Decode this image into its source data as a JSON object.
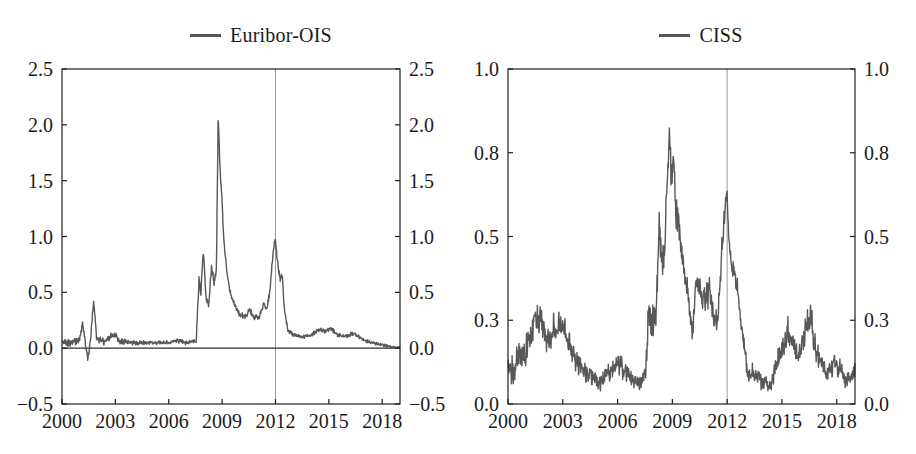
{
  "figure": {
    "background": "#ffffff",
    "text_color": "#1b1b1b",
    "frame_color": "#1f1f1f"
  },
  "charts": [
    {
      "legend": {
        "label": "Euribor-OIS",
        "swatch_color": "#585858"
      },
      "chart_data": {
        "type": "line",
        "title": "Euribor-OIS",
        "xlabel": "",
        "ylabel": "",
        "grid": false,
        "legend_position": "top-center",
        "x_axis": {
          "min": 2000,
          "max": 2019,
          "ticks": [
            2000,
            2003,
            2006,
            2009,
            2012,
            2015,
            2018
          ],
          "tick_labels": [
            "2000",
            "2003",
            "2006",
            "2009",
            "2012",
            "2015",
            "2018"
          ]
        },
        "y_axis": {
          "min": -0.5,
          "max": 2.5,
          "ticks": [
            -0.5,
            0,
            0.5,
            1,
            1.5,
            2,
            2.5
          ],
          "tick_labels": [
            "−0.5",
            "0.0",
            "0.5",
            "1.0",
            "1.5",
            "2.0",
            "2.5"
          ],
          "label_sides": "both"
        },
        "reference_lines": {
          "vertical_x": 2012,
          "vertical_color": "#9b9b9b",
          "horizontal_y": 0,
          "horizontal_color": "#2a2a2a"
        },
        "series": [
          {
            "name": "Euribor-OIS",
            "color": "#585858",
            "anchors": [
              [
                2000.0,
                0.05,
                0.035
              ],
              [
                2000.6,
                0.05,
                0.035
              ],
              [
                2001.0,
                0.08,
                0.05
              ],
              [
                2001.15,
                0.22,
                0.03
              ],
              [
                2001.3,
                0.06,
                0.04
              ],
              [
                2001.45,
                -0.1,
                0.03
              ],
              [
                2001.6,
                0.07,
                0.04
              ],
              [
                2001.78,
                0.43,
                0.02
              ],
              [
                2001.95,
                0.07,
                0.04
              ],
              [
                2002.4,
                0.06,
                0.035
              ],
              [
                2002.9,
                0.13,
                0.035
              ],
              [
                2003.3,
                0.06,
                0.03
              ],
              [
                2004.0,
                0.05,
                0.025
              ],
              [
                2005.0,
                0.05,
                0.02
              ],
              [
                2006.0,
                0.05,
                0.02
              ],
              [
                2006.5,
                0.07,
                0.025
              ],
              [
                2007.0,
                0.05,
                0.02
              ],
              [
                2007.55,
                0.06,
                0.02
              ],
              [
                2007.62,
                0.35,
                0.04
              ],
              [
                2007.7,
                0.62,
                0.05
              ],
              [
                2007.8,
                0.5,
                0.05
              ],
              [
                2007.95,
                0.88,
                0.04
              ],
              [
                2008.1,
                0.45,
                0.05
              ],
              [
                2008.25,
                0.38,
                0.04
              ],
              [
                2008.4,
                0.72,
                0.05
              ],
              [
                2008.55,
                0.6,
                0.04
              ],
              [
                2008.68,
                0.7,
                0.04
              ],
              [
                2008.78,
                2.07,
                0.03
              ],
              [
                2008.9,
                1.55,
                0.06
              ],
              [
                2009.0,
                1.3,
                0.05
              ],
              [
                2009.1,
                0.95,
                0.05
              ],
              [
                2009.25,
                0.7,
                0.04
              ],
              [
                2009.45,
                0.5,
                0.03
              ],
              [
                2009.7,
                0.38,
                0.03
              ],
              [
                2010.0,
                0.3,
                0.025
              ],
              [
                2010.35,
                0.28,
                0.03
              ],
              [
                2010.55,
                0.35,
                0.03
              ],
              [
                2010.8,
                0.27,
                0.025
              ],
              [
                2011.1,
                0.28,
                0.03
              ],
              [
                2011.35,
                0.4,
                0.03
              ],
              [
                2011.5,
                0.33,
                0.03
              ],
              [
                2011.65,
                0.48,
                0.03
              ],
              [
                2011.8,
                0.72,
                0.04
              ],
              [
                2011.97,
                1.0,
                0.03
              ],
              [
                2012.1,
                0.8,
                0.04
              ],
              [
                2012.25,
                0.62,
                0.03
              ],
              [
                2012.38,
                0.66,
                0.03
              ],
              [
                2012.5,
                0.35,
                0.03
              ],
              [
                2012.7,
                0.16,
                0.02
              ],
              [
                2013.0,
                0.12,
                0.02
              ],
              [
                2013.5,
                0.1,
                0.02
              ],
              [
                2014.0,
                0.12,
                0.02
              ],
              [
                2014.5,
                0.17,
                0.02
              ],
              [
                2014.8,
                0.15,
                0.02
              ],
              [
                2015.1,
                0.18,
                0.02
              ],
              [
                2015.5,
                0.12,
                0.02
              ],
              [
                2016.0,
                0.11,
                0.02
              ],
              [
                2016.4,
                0.13,
                0.02
              ],
              [
                2017.0,
                0.07,
                0.015
              ],
              [
                2017.6,
                0.04,
                0.015
              ],
              [
                2018.0,
                0.03,
                0.015
              ],
              [
                2018.5,
                0.01,
                0.012
              ],
              [
                2019.0,
                0.01,
                0.012
              ]
            ]
          }
        ]
      }
    },
    {
      "legend": {
        "label": "CISS",
        "swatch_color": "#585858"
      },
      "chart_data": {
        "type": "line",
        "title": "CISS",
        "xlabel": "",
        "ylabel": "",
        "grid": false,
        "legend_position": "top-center",
        "x_axis": {
          "min": 2000,
          "max": 2019,
          "ticks": [
            2000,
            2003,
            2006,
            2009,
            2012,
            2015,
            2018
          ],
          "tick_labels": [
            "2000",
            "2003",
            "2006",
            "2009",
            "2012",
            "2015",
            "2018"
          ]
        },
        "y_axis": {
          "min": 0,
          "max": 1,
          "ticks": [
            0,
            0.25,
            0.5,
            0.75,
            1
          ],
          "tick_labels": [
            "0.0",
            "0.3",
            "0.5",
            "0.8",
            "1.0"
          ],
          "label_sides": "both"
        },
        "reference_lines": {
          "vertical_x": 2012,
          "vertical_color": "#9b9b9b",
          "horizontal_y": null,
          "horizontal_color": null
        },
        "series": [
          {
            "name": "CISS",
            "color": "#585858",
            "anchors": [
              [
                2000.0,
                0.13,
                0.05
              ],
              [
                2000.3,
                0.1,
                0.05
              ],
              [
                2000.6,
                0.16,
                0.05
              ],
              [
                2000.9,
                0.14,
                0.05
              ],
              [
                2001.2,
                0.2,
                0.05
              ],
              [
                2001.5,
                0.26,
                0.045
              ],
              [
                2001.75,
                0.26,
                0.045
              ],
              [
                2002.1,
                0.2,
                0.05
              ],
              [
                2002.5,
                0.22,
                0.05
              ],
              [
                2002.8,
                0.25,
                0.04
              ],
              [
                2003.1,
                0.22,
                0.04
              ],
              [
                2003.5,
                0.15,
                0.04
              ],
              [
                2004.0,
                0.11,
                0.035
              ],
              [
                2004.5,
                0.08,
                0.03
              ],
              [
                2005.0,
                0.07,
                0.03
              ],
              [
                2005.5,
                0.09,
                0.035
              ],
              [
                2006.0,
                0.12,
                0.04
              ],
              [
                2006.3,
                0.1,
                0.035
              ],
              [
                2006.8,
                0.07,
                0.03
              ],
              [
                2007.2,
                0.06,
                0.025
              ],
              [
                2007.55,
                0.09,
                0.03
              ],
              [
                2007.7,
                0.28,
                0.06
              ],
              [
                2007.9,
                0.24,
                0.06
              ],
              [
                2008.1,
                0.26,
                0.06
              ],
              [
                2008.28,
                0.53,
                0.06
              ],
              [
                2008.45,
                0.42,
                0.06
              ],
              [
                2008.6,
                0.5,
                0.06
              ],
              [
                2008.75,
                0.72,
                0.05
              ],
              [
                2008.85,
                0.82,
                0.035
              ],
              [
                2008.95,
                0.66,
                0.07
              ],
              [
                2009.05,
                0.76,
                0.05
              ],
              [
                2009.15,
                0.6,
                0.07
              ],
              [
                2009.3,
                0.55,
                0.06
              ],
              [
                2009.5,
                0.45,
                0.05
              ],
              [
                2009.7,
                0.38,
                0.05
              ],
              [
                2009.9,
                0.32,
                0.05
              ],
              [
                2010.1,
                0.21,
                0.04
              ],
              [
                2010.35,
                0.4,
                0.05
              ],
              [
                2010.55,
                0.32,
                0.05
              ],
              [
                2010.8,
                0.3,
                0.05
              ],
              [
                2011.0,
                0.35,
                0.05
              ],
              [
                2011.25,
                0.28,
                0.05
              ],
              [
                2011.5,
                0.24,
                0.04
              ],
              [
                2011.7,
                0.45,
                0.06
              ],
              [
                2011.9,
                0.58,
                0.05
              ],
              [
                2011.97,
                0.63,
                0.04
              ],
              [
                2012.15,
                0.45,
                0.05
              ],
              [
                2012.35,
                0.42,
                0.05
              ],
              [
                2012.55,
                0.35,
                0.05
              ],
              [
                2012.75,
                0.25,
                0.04
              ],
              [
                2012.95,
                0.15,
                0.04
              ],
              [
                2013.2,
                0.1,
                0.035
              ],
              [
                2013.6,
                0.08,
                0.03
              ],
              [
                2014.0,
                0.07,
                0.03
              ],
              [
                2014.35,
                0.05,
                0.025
              ],
              [
                2014.7,
                0.12,
                0.04
              ],
              [
                2015.0,
                0.15,
                0.045
              ],
              [
                2015.3,
                0.22,
                0.05
              ],
              [
                2015.6,
                0.18,
                0.05
              ],
              [
                2015.9,
                0.14,
                0.04
              ],
              [
                2016.2,
                0.2,
                0.05
              ],
              [
                2016.55,
                0.27,
                0.05
              ],
              [
                2016.8,
                0.18,
                0.05
              ],
              [
                2017.1,
                0.13,
                0.04
              ],
              [
                2017.5,
                0.09,
                0.03
              ],
              [
                2017.9,
                0.13,
                0.04
              ],
              [
                2018.2,
                0.1,
                0.035
              ],
              [
                2018.5,
                0.07,
                0.03
              ],
              [
                2018.8,
                0.08,
                0.03
              ],
              [
                2019.05,
                0.1,
                0.03
              ]
            ]
          }
        ]
      }
    }
  ]
}
